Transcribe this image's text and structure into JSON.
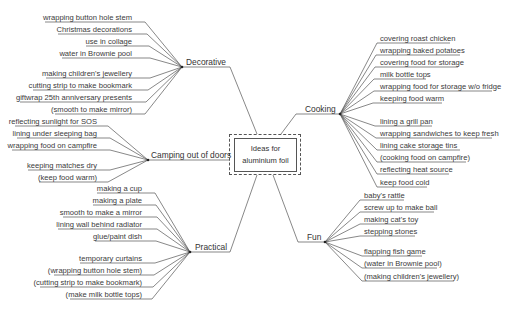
{
  "center": {
    "line1": "Ideas for",
    "line2": "aluminium foil"
  },
  "branches": {
    "decorative": {
      "label": "Decorative",
      "items": [
        "wrapping button hole stem",
        "Christmas decorations",
        "use in collage",
        "water in Brownie pool",
        "making children's jewellery",
        "cutting strip to make bookmark",
        "giftwrap 25th anniversary presents",
        "(smooth to make mirror)"
      ]
    },
    "camping": {
      "label": "Camping out of doors",
      "items": [
        "reflecting sunlight for SOS",
        "lining under sleeping bag",
        "wrapping food on campfire",
        "keeping matches dry",
        "(keep food warm)"
      ]
    },
    "practical": {
      "label": "Practical",
      "items": [
        "making a cup",
        "making a plate",
        "smooth to make a mirror",
        "lining wall behind radiator",
        "glue/paint dish",
        "temporary curtains",
        "(wrapping button hole stem)",
        "(cutting strip to make bookmark)",
        "(make milk bottle tops)"
      ]
    },
    "cooking": {
      "label": "Cooking",
      "items": [
        "covering roast chicken",
        "wrapping baked potatoes",
        "covering food for storage",
        "milk bottle tops",
        "wrapping food for storage w/o fridge",
        "keeping food warm",
        "lining a grill pan",
        "wrapping sandwiches to keep fresh",
        "lining cake storage tins",
        "(cooking food on campfire)",
        "reflecting heat source",
        "keep food cold"
      ]
    },
    "fun": {
      "label": "Fun",
      "items": [
        "baby's rattle",
        "screw up to make ball",
        "making cat's toy",
        "stepping stones",
        "flapping fish game",
        "(water in Brownie pool)",
        "(making children's jewellery)"
      ]
    }
  },
  "colors": {
    "line": "#555555",
    "text": "#3a3a3a",
    "background": "#ffffff"
  }
}
